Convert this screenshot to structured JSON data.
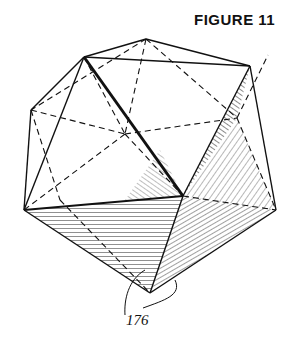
{
  "figure": {
    "title": "FIGURE 11",
    "reference_label": "176"
  }
}
